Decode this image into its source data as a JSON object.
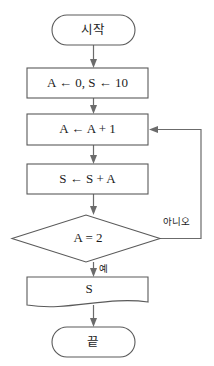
{
  "diagram": {
    "type": "flowchart",
    "title": "",
    "orientation": "top-to-bottom",
    "language": "ko"
  },
  "nodes": {
    "start": {
      "shape": "terminator",
      "label": "시작"
    },
    "init": {
      "shape": "process",
      "label": "A ← 0, S ← 10"
    },
    "increment": {
      "shape": "process",
      "label": "A ← A + 1"
    },
    "accumulate": {
      "shape": "process",
      "label": "S ← S + A"
    },
    "decision": {
      "shape": "decision",
      "label": "A = 2"
    },
    "output": {
      "shape": "document",
      "label": "S"
    },
    "end": {
      "shape": "terminator",
      "label": "끝"
    }
  },
  "branches": {
    "no_label": "아니오",
    "yes_label": "예"
  },
  "colors": {
    "background": "#ffffff",
    "stroke": "#5a5a5a",
    "connector": "#6b6b6b",
    "text": "#1c1c1c"
  }
}
